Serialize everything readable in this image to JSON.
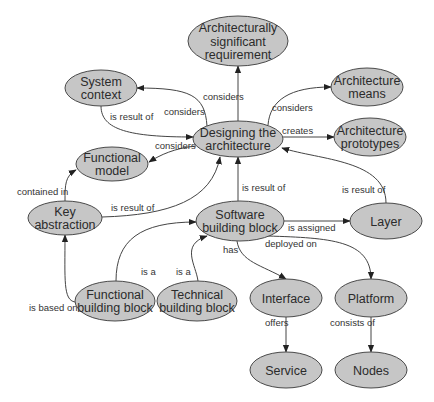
{
  "diagram": {
    "type": "concept-map",
    "colors": {
      "node_fill": "#c6c6c6",
      "node_stroke": "#4a4a4a",
      "edge": "#444444",
      "text": "#2b2b2b",
      "background": "#ffffff"
    },
    "nodes": [
      {
        "id": "asr",
        "lines": [
          "Architecturally",
          "significant",
          "requirement"
        ],
        "cx": 238,
        "cy": 41,
        "rx": 50,
        "ry": 25
      },
      {
        "id": "system_context",
        "lines": [
          "System",
          "context"
        ],
        "cx": 101,
        "cy": 88,
        "rx": 36,
        "ry": 18
      },
      {
        "id": "arch_means",
        "lines": [
          "Architecture",
          "means"
        ],
        "cx": 367,
        "cy": 87,
        "rx": 36,
        "ry": 19
      },
      {
        "id": "designing",
        "lines": [
          "Designing the",
          "architecture"
        ],
        "cx": 238,
        "cy": 139,
        "rx": 45,
        "ry": 18
      },
      {
        "id": "arch_prototypes",
        "lines": [
          "Architecture",
          "prototypes"
        ],
        "cx": 370,
        "cy": 137,
        "rx": 36,
        "ry": 19
      },
      {
        "id": "functional_model",
        "lines": [
          "Functional",
          "model"
        ],
        "cx": 112,
        "cy": 164,
        "rx": 36,
        "ry": 17
      },
      {
        "id": "key_abstraction",
        "lines": [
          "Key",
          "abstraction"
        ],
        "cx": 65,
        "cy": 218,
        "rx": 37,
        "ry": 17
      },
      {
        "id": "software_bb",
        "lines": [
          "Software",
          "building block"
        ],
        "cx": 240,
        "cy": 221,
        "rx": 44,
        "ry": 20
      },
      {
        "id": "layer",
        "lines": [
          "Layer"
        ],
        "cx": 386,
        "cy": 221,
        "rx": 36,
        "ry": 18
      },
      {
        "id": "functional_bb",
        "lines": [
          "Functional",
          "building block"
        ],
        "cx": 115,
        "cy": 301,
        "rx": 40,
        "ry": 20
      },
      {
        "id": "technical_bb",
        "lines": [
          "Technical",
          "building block"
        ],
        "cx": 197,
        "cy": 301,
        "rx": 40,
        "ry": 20
      },
      {
        "id": "interface",
        "lines": [
          "Interface"
        ],
        "cx": 286,
        "cy": 298,
        "rx": 36,
        "ry": 19
      },
      {
        "id": "platform",
        "lines": [
          "Platform"
        ],
        "cx": 371,
        "cy": 298,
        "rx": 36,
        "ry": 19
      },
      {
        "id": "service",
        "lines": [
          "Service"
        ],
        "cx": 286,
        "cy": 370,
        "rx": 36,
        "ry": 18
      },
      {
        "id": "nodes",
        "lines": [
          "Nodes"
        ],
        "cx": 371,
        "cy": 370,
        "rx": 36,
        "ry": 18
      }
    ],
    "edges": [
      {
        "from": "designing",
        "to": "asr",
        "label": "considers",
        "d": "M 238 121 L 238 66",
        "lx": 203,
        "ly": 100
      },
      {
        "from": "designing",
        "to": "system_context",
        "label": "considers",
        "d": "M 207 126 C 205 95 190 88 137 88",
        "lx": 164,
        "ly": 115
      },
      {
        "from": "system_context",
        "to": "designing",
        "label": "is result of",
        "d": "M 101 106 C 101 130 130 137 193 137",
        "lx": 110,
        "ly": 120
      },
      {
        "from": "designing",
        "to": "functional_model",
        "label": "considers",
        "d": "M 196 146 C 175 148 160 155 149 162",
        "lx": 155,
        "ly": 149
      },
      {
        "from": "designing",
        "to": "arch_means",
        "label": "considers",
        "d": "M 268 125 C 270 100 290 87 331 87",
        "lx": 272,
        "ly": 111
      },
      {
        "from": "designing",
        "to": "arch_prototypes",
        "label": "creates",
        "d": "M 283 137 L 334 137",
        "lx": 282,
        "ly": 134
      },
      {
        "from": "key_abstraction",
        "to": "functional_model",
        "label": "contained in",
        "d": "M 65 201 C 65 185 65 176 76 170",
        "lx": 17,
        "ly": 195
      },
      {
        "from": "key_abstraction",
        "to": "designing",
        "label": "is result of",
        "d": "M 102 217 C 170 215 212 200 220 157",
        "lx": 111,
        "ly": 211
      },
      {
        "from": "software_bb",
        "to": "designing",
        "label": "is result of",
        "d": "M 238 201 L 238 157",
        "lx": 242,
        "ly": 191
      },
      {
        "from": "layer",
        "to": "designing",
        "label": "is result of",
        "d": "M 386 203 C 386 160 320 160 282 148",
        "lx": 342,
        "ly": 193
      },
      {
        "from": "software_bb",
        "to": "layer",
        "label": "is assigned",
        "d": "M 284 221 L 350 221",
        "lx": 288,
        "ly": 231
      },
      {
        "from": "software_bb",
        "to": "interface",
        "label": "has",
        "d": "M 237 241 C 240 262 262 265 286 279",
        "lx": 223,
        "ly": 253
      },
      {
        "from": "software_bb",
        "to": "platform",
        "label": "deployed on",
        "d": "M 268 236 C 330 238 371 240 371 279",
        "lx": 265,
        "ly": 247
      },
      {
        "from": "functional_bb",
        "to": "software_bb",
        "label": "is a",
        "d": "M 116 281 C 116 240 140 222 196 222",
        "lx": 141,
        "ly": 275
      },
      {
        "from": "technical_bb",
        "to": "software_bb",
        "label": "is a",
        "d": "M 198 281 C 196 265 180 245 207 236",
        "lx": 176,
        "ly": 275
      },
      {
        "from": "functional_bb",
        "to": "key_abstraction",
        "label": "is based on",
        "d": "M 75 302 C 63 300 65 280 65 235",
        "lx": 29,
        "ly": 311
      },
      {
        "from": "interface",
        "to": "service",
        "label": "offers",
        "d": "M 286 317 L 286 352",
        "lx": 265,
        "ly": 326
      },
      {
        "from": "platform",
        "to": "nodes",
        "label": "consists of",
        "d": "M 371 317 L 371 352",
        "lx": 330,
        "ly": 326
      }
    ]
  }
}
